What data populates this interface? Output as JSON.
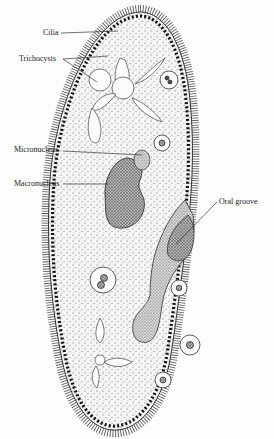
{
  "diagram": {
    "labels": [
      {
        "id": "cilia",
        "text": "Cilia"
      },
      {
        "id": "trichocysts",
        "text": "Trichocysts"
      },
      {
        "id": "micronucleus",
        "text": "Micronucleus"
      },
      {
        "id": "macronucleus",
        "text": "Macronucleus"
      },
      {
        "id": "oral-groove",
        "text": "Oral groove"
      }
    ]
  }
}
